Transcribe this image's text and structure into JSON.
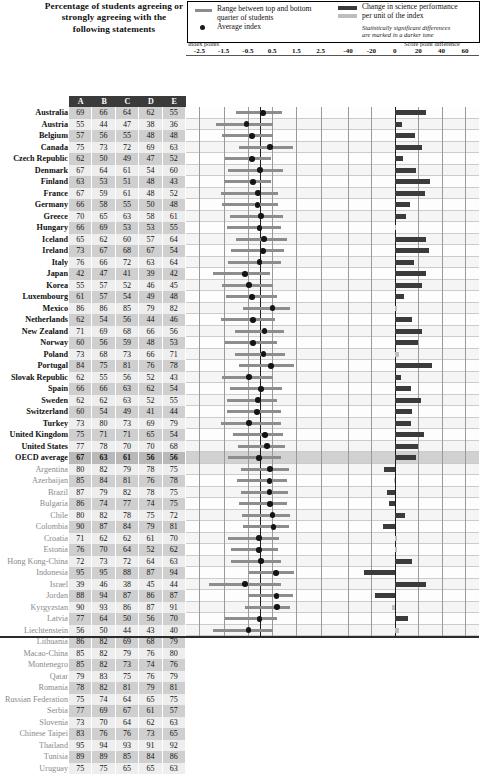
{
  "header": {
    "title": "Percentage of students agreeing or strongly agreeing with the following statements",
    "legend": {
      "range_label_line1": "Range between top and bottom",
      "range_label_line2": "quarter of students",
      "average_label": "Average index",
      "change_label_line1": "Change in science performance",
      "change_label_line2": "per unit of the index",
      "note_line1": "Statistically significant differences",
      "note_line2": "are marked in a darker tone"
    },
    "left_axis_label": "Index points",
    "right_axis_label": "Score point difference",
    "left_ticks": [
      "-2.5",
      "-1.5",
      "-0.5",
      "0.5",
      "1.5",
      "2.5"
    ],
    "right_ticks": [
      "-40",
      "-20",
      "0",
      "20",
      "40",
      "60"
    ]
  },
  "table": {
    "columns": [
      "A",
      "B",
      "C",
      "D",
      "E"
    ]
  },
  "chart_data": {
    "type": "bar",
    "title": "Percentage of students agreeing or strongly agreeing with the following statements",
    "left_panel": {
      "type": "range",
      "xlabel": "Index points",
      "xlim": [
        -3.0,
        3.0
      ],
      "ticks": [
        -2.5,
        -1.5,
        -0.5,
        0.5,
        1.5,
        2.5
      ],
      "series": [
        "Range between top and bottom quarter of students",
        "Average index"
      ]
    },
    "right_panel": {
      "type": "bar",
      "xlabel": "Score point difference",
      "xlim": [
        -50,
        70
      ],
      "ticks": [
        -40,
        -20,
        0,
        20,
        40,
        60
      ],
      "series": [
        "Change in science performance per unit of the index"
      ]
    },
    "categories": [
      "Australia",
      "Austria",
      "Belgium",
      "Canada",
      "Czech Republic",
      "Denmark",
      "Finland",
      "France",
      "Germany",
      "Greece",
      "Hungary",
      "Iceland",
      "Ireland",
      "Italy",
      "Japan",
      "Korea",
      "Luxembourg",
      "Mexico",
      "Netherlands",
      "New Zealand",
      "Norway",
      "Poland",
      "Portugal",
      "Slovak Republic",
      "Spain",
      "Sweden",
      "Switzerland",
      "Turkey",
      "United Kingdom",
      "United States",
      "OECD average",
      "Argentina",
      "Azerbaijan",
      "Brazil",
      "Bulgaria",
      "Chile",
      "Colombia",
      "Croatia",
      "Estonia",
      "Hong Kong-China",
      "Indonesia",
      "Israel",
      "Jordan",
      "Kyrgyzstan",
      "Latvia",
      "Liechtenstein",
      "Lithuania",
      "Macao-China",
      "Montenegro",
      "Qatar",
      "Romania",
      "Russian Federation",
      "Serbia",
      "Slovenia",
      "Chinese Taipei",
      "Thailand",
      "Tunisia",
      "Uruguay"
    ]
  },
  "rows": [
    {
      "name": "Australia",
      "group": "oecd",
      "values": [
        69,
        66,
        64,
        62,
        55
      ],
      "range": [
        -1.0,
        0.9
      ],
      "avg": 0.12,
      "change": 27,
      "sig": true
    },
    {
      "name": "Austria",
      "group": "oecd",
      "values": [
        55,
        44,
        47,
        38,
        36
      ],
      "range": [
        -1.8,
        0.55
      ],
      "avg": -0.55,
      "change": 6,
      "sig": true
    },
    {
      "name": "Belgium",
      "group": "oecd",
      "values": [
        57,
        56,
        55,
        48,
        48
      ],
      "range": [
        -1.55,
        0.55
      ],
      "avg": -0.33,
      "change": 17,
      "sig": true
    },
    {
      "name": "Canada",
      "group": "oecd",
      "values": [
        75,
        73,
        72,
        69,
        63
      ],
      "range": [
        -0.85,
        1.35
      ],
      "avg": 0.42,
      "change": 23,
      "sig": true
    },
    {
      "name": "Czech Republic",
      "group": "oecd",
      "values": [
        62,
        50,
        49,
        47,
        52
      ],
      "range": [
        -1.45,
        0.45
      ],
      "avg": -0.32,
      "change": 7,
      "sig": true
    },
    {
      "name": "Denmark",
      "group": "oecd",
      "values": [
        67,
        64,
        61,
        54,
        60
      ],
      "range": [
        -1.3,
        0.95
      ],
      "avg": 0.0,
      "change": 18,
      "sig": true
    },
    {
      "name": "Finland",
      "group": "oecd",
      "values": [
        63,
        53,
        51,
        48,
        43
      ],
      "range": [
        -1.5,
        0.45
      ],
      "avg": -0.3,
      "change": 30,
      "sig": true
    },
    {
      "name": "France",
      "group": "oecd",
      "values": [
        67,
        59,
        61,
        48,
        52
      ],
      "range": [
        -1.6,
        0.75
      ],
      "avg": -0.08,
      "change": 26,
      "sig": true
    },
    {
      "name": "Germany",
      "group": "oecd",
      "values": [
        66,
        58,
        55,
        50,
        48
      ],
      "range": [
        -1.55,
        0.75
      ],
      "avg": -0.1,
      "change": 13,
      "sig": true
    },
    {
      "name": "Greece",
      "group": "oecd",
      "values": [
        70,
        65,
        63,
        58,
        61
      ],
      "range": [
        -1.25,
        0.95
      ],
      "avg": 0.05,
      "change": 10,
      "sig": true
    },
    {
      "name": "Hungary",
      "group": "oecd",
      "values": [
        66,
        69,
        53,
        53,
        55
      ],
      "range": [
        -1.35,
        0.85
      ],
      "avg": -0.02,
      "change": 1,
      "sig": false
    },
    {
      "name": "Iceland",
      "group": "oecd",
      "values": [
        65,
        62,
        60,
        57,
        64
      ],
      "range": [
        -1.0,
        1.1
      ],
      "avg": 0.17,
      "change": 27,
      "sig": true
    },
    {
      "name": "Ireland",
      "group": "oecd",
      "values": [
        73,
        67,
        68,
        67,
        54
      ],
      "range": [
        -1.2,
        1.0
      ],
      "avg": 0.12,
      "change": 29,
      "sig": true
    },
    {
      "name": "Italy",
      "group": "oecd",
      "values": [
        76,
        66,
        72,
        63,
        64
      ],
      "range": [
        -1.3,
        0.85
      ],
      "avg": -0.02,
      "change": 16,
      "sig": true
    },
    {
      "name": "Japan",
      "group": "oecd",
      "values": [
        42,
        47,
        41,
        39,
        42
      ],
      "range": [
        -1.95,
        0.4
      ],
      "avg": -0.62,
      "change": 27,
      "sig": true
    },
    {
      "name": "Korea",
      "group": "oecd",
      "values": [
        55,
        57,
        52,
        46,
        45
      ],
      "range": [
        -1.55,
        0.55
      ],
      "avg": -0.45,
      "change": 23,
      "sig": true
    },
    {
      "name": "Luxembourg",
      "group": "oecd",
      "values": [
        61,
        57,
        54,
        49,
        48
      ],
      "range": [
        -1.4,
        0.7
      ],
      "avg": -0.33,
      "change": 8,
      "sig": true
    },
    {
      "name": "Mexico",
      "group": "oecd",
      "values": [
        86,
        86,
        85,
        79,
        82
      ],
      "range": [
        -0.7,
        1.25
      ],
      "avg": 0.52,
      "change": 2,
      "sig": false
    },
    {
      "name": "Netherlands",
      "group": "oecd",
      "values": [
        62,
        54,
        56,
        44,
        46
      ],
      "range": [
        -1.6,
        0.6
      ],
      "avg": -0.3,
      "change": 15,
      "sig": true
    },
    {
      "name": "New Zealand",
      "group": "oecd",
      "values": [
        71,
        69,
        68,
        66,
        56
      ],
      "range": [
        -1.05,
        1.0
      ],
      "avg": 0.18,
      "change": 23,
      "sig": true
    },
    {
      "name": "Norway",
      "group": "oecd",
      "values": [
        60,
        56,
        59,
        48,
        53
      ],
      "range": [
        -1.45,
        0.7
      ],
      "avg": -0.3,
      "change": 20,
      "sig": true
    },
    {
      "name": "Poland",
      "group": "oecd",
      "values": [
        73,
        68,
        73,
        66,
        71
      ],
      "range": [
        -1.05,
        1.05
      ],
      "avg": 0.15,
      "change": 4,
      "sig": false
    },
    {
      "name": "Portugal",
      "group": "oecd",
      "values": [
        84,
        75,
        81,
        76,
        78
      ],
      "range": [
        -0.85,
        1.4
      ],
      "avg": 0.45,
      "change": 32,
      "sig": true
    },
    {
      "name": "Slovak Republic",
      "group": "oecd",
      "values": [
        62,
        55,
        56,
        52,
        43
      ],
      "range": [
        -1.55,
        0.55
      ],
      "avg": -0.45,
      "change": 5,
      "sig": true
    },
    {
      "name": "Spain",
      "group": "oecd",
      "values": [
        66,
        66,
        63,
        62,
        54
      ],
      "range": [
        -1.25,
        0.9
      ],
      "avg": 0.05,
      "change": 14,
      "sig": true
    },
    {
      "name": "Sweden",
      "group": "oecd",
      "values": [
        62,
        62,
        63,
        52,
        55
      ],
      "range": [
        -1.35,
        0.7
      ],
      "avg": -0.08,
      "change": 22,
      "sig": true
    },
    {
      "name": "Switzerland",
      "group": "oecd",
      "values": [
        60,
        54,
        49,
        41,
        44
      ],
      "range": [
        -1.35,
        0.85
      ],
      "avg": -0.12,
      "change": 15,
      "sig": true
    },
    {
      "name": "Turkey",
      "group": "oecd",
      "values": [
        73,
        80,
        73,
        69,
        79
      ],
      "range": [
        -1.6,
        0.85
      ],
      "avg": -0.45,
      "change": 14,
      "sig": true
    },
    {
      "name": "United Kingdom",
      "group": "oecd",
      "values": [
        75,
        71,
        71,
        65,
        54
      ],
      "range": [
        -1.1,
        0.95
      ],
      "avg": 0.2,
      "change": 25,
      "sig": true
    },
    {
      "name": "United States",
      "group": "oecd",
      "values": [
        77,
        78,
        70,
        70,
        68
      ],
      "range": [
        -0.9,
        1.05
      ],
      "avg": 0.28,
      "change": 20,
      "sig": true
    },
    {
      "name": "OECD average",
      "group": "average",
      "values": [
        67,
        63,
        61,
        56,
        56
      ],
      "range": [
        -1.3,
        0.85
      ],
      "avg": -0.03,
      "change": 18,
      "sig": true
    },
    {
      "name": "Argentina",
      "group": "partner",
      "values": [
        80,
        82,
        79,
        78,
        75
      ],
      "range": [
        -0.8,
        1.2
      ],
      "avg": 0.42,
      "change": -9,
      "sig": true
    },
    {
      "name": "Azerbaijan",
      "group": "partner",
      "values": [
        85,
        84,
        81,
        76,
        78
      ],
      "range": [
        -0.95,
        1.1
      ],
      "avg": 0.4,
      "change": -1,
      "sig": false
    },
    {
      "name": "Brazil",
      "group": "partner",
      "values": [
        87,
        79,
        82,
        78,
        75
      ],
      "range": [
        -0.8,
        1.15
      ],
      "avg": 0.4,
      "change": -7,
      "sig": true
    },
    {
      "name": "Bulgaria",
      "group": "partner",
      "values": [
        86,
        74,
        77,
        74,
        75
      ],
      "range": [
        -0.85,
        1.1
      ],
      "avg": 0.42,
      "change": -5,
      "sig": true
    },
    {
      "name": "Chile",
      "group": "partner",
      "values": [
        80,
        82,
        78,
        75,
        72
      ],
      "range": [
        -0.75,
        1.25
      ],
      "avg": 0.52,
      "change": 9,
      "sig": true
    },
    {
      "name": "Colombia",
      "group": "partner",
      "values": [
        90,
        87,
        84,
        79,
        81
      ],
      "range": [
        -0.7,
        1.2
      ],
      "avg": 0.55,
      "change": -10,
      "sig": true
    },
    {
      "name": "Croatia",
      "group": "partner",
      "values": [
        71,
        62,
        62,
        61,
        70
      ],
      "range": [
        -1.3,
        0.8
      ],
      "avg": -0.05,
      "change": 2,
      "sig": false
    },
    {
      "name": "Estonia",
      "group": "partner",
      "values": [
        76,
        70,
        64,
        52,
        62
      ],
      "range": [
        -1.2,
        0.75
      ],
      "avg": -0.05,
      "change": 2,
      "sig": false
    },
    {
      "name": "Hong Kong-China",
      "group": "partner",
      "values": [
        72,
        73,
        72,
        64,
        63
      ],
      "range": [
        -1.2,
        0.85
      ],
      "avg": 0.05,
      "change": 15,
      "sig": true
    },
    {
      "name": "Indonesia",
      "group": "partner",
      "values": [
        95,
        95,
        88,
        87,
        94
      ],
      "range": [
        -0.45,
        1.4
      ],
      "avg": 0.65,
      "change": -26,
      "sig": true
    },
    {
      "name": "Israel",
      "group": "partner",
      "values": [
        39,
        46,
        38,
        45,
        44
      ],
      "range": [
        -2.1,
        0.85
      ],
      "avg": -0.62,
      "change": 27,
      "sig": true
    },
    {
      "name": "Jordan",
      "group": "partner",
      "values": [
        88,
        94,
        87,
        86,
        87
      ],
      "range": [
        -0.5,
        1.35
      ],
      "avg": 0.68,
      "change": -17,
      "sig": true
    },
    {
      "name": "Kyrgyzstan",
      "group": "partner",
      "values": [
        90,
        93,
        86,
        87,
        91
      ],
      "range": [
        -0.6,
        1.25
      ],
      "avg": 0.7,
      "change": -2,
      "sig": false
    },
    {
      "name": "Latvia",
      "group": "partner",
      "values": [
        77,
        64,
        50,
        56,
        70
      ],
      "range": [
        -1.45,
        0.7
      ],
      "avg": -0.02,
      "change": 11,
      "sig": true
    },
    {
      "name": "Liechtenstein",
      "group": "partner",
      "values": [
        56,
        50,
        44,
        43,
        40
      ],
      "range": [
        -1.95,
        0.55
      ],
      "avg": -0.48,
      "change": 4,
      "sig": false
    },
    {
      "name": "Lithuania",
      "group": "partner",
      "values": [
        86,
        82,
        69,
        68,
        79
      ],
      "range": [
        -1.0,
        1.0
      ],
      "avg": 0.22,
      "change": 18,
      "sig": true
    },
    {
      "name": "Macao-China",
      "group": "partner",
      "values": [
        85,
        82,
        79,
        76,
        80
      ],
      "range": [
        -1.0,
        0.95
      ],
      "avg": 0.22,
      "change": -9,
      "sig": true
    },
    {
      "name": "Montenegro",
      "group": "partner",
      "values": [
        85,
        82,
        73,
        74,
        76
      ],
      "range": [
        -0.95,
        1.05
      ],
      "avg": 0.22,
      "change": 13,
      "sig": true
    },
    {
      "name": "Qatar",
      "group": "partner",
      "values": [
        79,
        83,
        75,
        76,
        79
      ],
      "range": [
        -0.95,
        1.1
      ],
      "avg": 0.25,
      "change": -3,
      "sig": false
    },
    {
      "name": "Romania",
      "group": "partner",
      "values": [
        78,
        82,
        81,
        79,
        81
      ],
      "range": [
        -0.8,
        1.2
      ],
      "avg": 0.42,
      "change": 12,
      "sig": true
    },
    {
      "name": "Russian Federation",
      "group": "partner",
      "values": [
        75,
        74,
        64,
        65,
        75
      ],
      "range": [
        -1.15,
        0.9
      ],
      "avg": 0.08,
      "change": -1,
      "sig": false
    },
    {
      "name": "Serbia",
      "group": "partner",
      "values": [
        77,
        69,
        67,
        61,
        57
      ],
      "range": [
        -1.4,
        0.7
      ],
      "avg": -0.05,
      "change": -11,
      "sig": true
    },
    {
      "name": "Slovenia",
      "group": "partner",
      "values": [
        73,
        70,
        64,
        62,
        63
      ],
      "range": [
        -1.35,
        0.75
      ],
      "avg": -0.05,
      "change": -8,
      "sig": true
    },
    {
      "name": "Chinese Taipei",
      "group": "partner",
      "values": [
        83,
        76,
        76,
        73,
        65
      ],
      "range": [
        -1.15,
        0.9
      ],
      "avg": 0.12,
      "change": 11,
      "sig": true
    },
    {
      "name": "Thailand",
      "group": "partner",
      "values": [
        95,
        94,
        93,
        91,
        92
      ],
      "range": [
        -0.65,
        1.25
      ],
      "avg": 0.45,
      "change": 18,
      "sig": true
    },
    {
      "name": "Tunisia",
      "group": "partner",
      "values": [
        89,
        89,
        85,
        84,
        86
      ],
      "range": [
        -0.7,
        1.35
      ],
      "avg": 0.52,
      "change": 22,
      "sig": true
    },
    {
      "name": "Uruguay",
      "group": "partner",
      "values": [
        75,
        75,
        65,
        65,
        63
      ],
      "range": [
        -1.1,
        0.95
      ],
      "avg": 0.1,
      "change": -3,
      "sig": false
    }
  ]
}
